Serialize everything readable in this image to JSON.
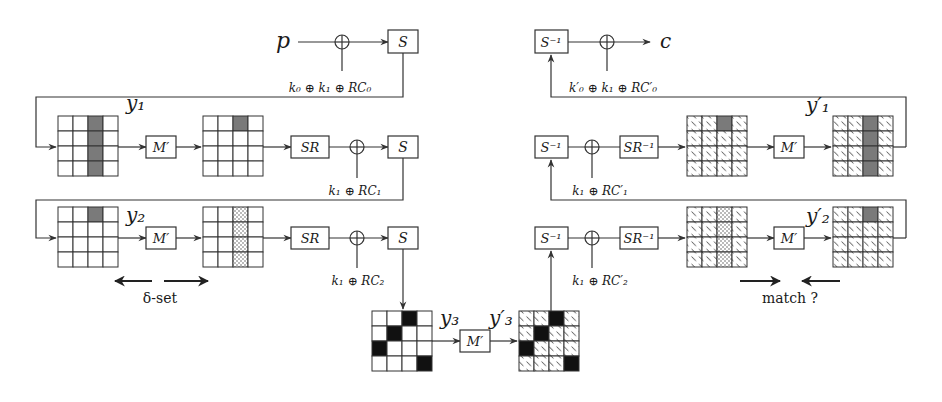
{
  "diagram": {
    "colors": {
      "gray_cell": "#7a7a7a",
      "black_cell": "#111111",
      "stroke": "#333333"
    },
    "top_left": {
      "input_label": "p",
      "sbox_label": "S",
      "key_label": "k₀ ⊕ k₁ ⊕ RC₀"
    },
    "top_right": {
      "output_label": "c",
      "sbox_inv_label": "S⁻¹",
      "key_label": "k′₀ ⊕ k₁ ⊕ RC′₀"
    },
    "row1_left": {
      "state_label": "y₁",
      "mix_label": "M′",
      "shift_label": "SR",
      "sbox_label": "S",
      "key_label": "k₁ ⊕ RC₁"
    },
    "row2_left": {
      "state_label": "y₂",
      "mix_label": "M′",
      "shift_label": "SR",
      "sbox_label": "S",
      "key_label": "k₁ ⊕ RC₂",
      "delta_set_label": "δ-set"
    },
    "row1_right": {
      "state_label": "y′₁",
      "mix_label": "M′",
      "shift_inv_label": "SR⁻¹",
      "sbox_inv_label": "S⁻¹",
      "key_label": "k₁ ⊕ RC′₁"
    },
    "row2_right": {
      "state_label": "y′₂",
      "mix_label": "M′",
      "shift_inv_label": "SR⁻¹",
      "sbox_inv_label": "S⁻¹",
      "key_label": "k₁ ⊕ RC′₂",
      "match_label": "match ?"
    },
    "middle": {
      "y3_label": "y₃",
      "y3p_label": "y′₃",
      "mix_label": "M′"
    },
    "grids": [
      {
        "id": "L1a",
        "x": 58,
        "y": 116,
        "cell": 15,
        "hatched": false,
        "gray": [
          [
            0,
            2
          ],
          [
            1,
            2
          ],
          [
            2,
            2
          ],
          [
            3,
            2
          ]
        ],
        "dots": [],
        "black": []
      },
      {
        "id": "L1b",
        "x": 203,
        "y": 116,
        "cell": 15,
        "hatched": false,
        "gray": [
          [
            0,
            2
          ]
        ],
        "dots": [],
        "black": []
      },
      {
        "id": "L2a",
        "x": 58,
        "y": 207,
        "cell": 15,
        "hatched": false,
        "gray": [
          [
            0,
            2
          ]
        ],
        "dots": [],
        "black": []
      },
      {
        "id": "L2b",
        "x": 203,
        "y": 207,
        "cell": 15,
        "hatched": false,
        "gray": [],
        "dots": [
          [
            0,
            2
          ],
          [
            1,
            2
          ],
          [
            2,
            2
          ],
          [
            3,
            2
          ]
        ],
        "black": []
      },
      {
        "id": "R1a",
        "x": 687,
        "y": 116,
        "cell": 15,
        "hatched": true,
        "gray": [
          [
            0,
            2
          ]
        ],
        "dots": [],
        "black": []
      },
      {
        "id": "R1b",
        "x": 833,
        "y": 116,
        "cell": 15,
        "hatched": true,
        "gray": [
          [
            0,
            2
          ],
          [
            1,
            2
          ],
          [
            2,
            2
          ],
          [
            3,
            2
          ]
        ],
        "dots": [],
        "black": []
      },
      {
        "id": "R2a",
        "x": 687,
        "y": 207,
        "cell": 15,
        "hatched": true,
        "gray": [],
        "dots": [
          [
            0,
            2
          ],
          [
            1,
            2
          ],
          [
            2,
            2
          ],
          [
            3,
            2
          ]
        ],
        "black": []
      },
      {
        "id": "R2b",
        "x": 833,
        "y": 207,
        "cell": 15,
        "hatched": true,
        "gray": [
          [
            0,
            2
          ]
        ],
        "dots": [],
        "black": []
      },
      {
        "id": "Y3",
        "x": 372,
        "y": 311,
        "cell": 15,
        "hatched": false,
        "gray": [],
        "dots": [],
        "black": [
          [
            0,
            2
          ],
          [
            1,
            1
          ],
          [
            2,
            0
          ],
          [
            3,
            3
          ]
        ]
      },
      {
        "id": "Y3p",
        "x": 519,
        "y": 311,
        "cell": 15,
        "hatched": true,
        "gray": [],
        "dots": [],
        "black": [
          [
            0,
            2
          ],
          [
            1,
            1
          ],
          [
            2,
            0
          ],
          [
            3,
            3
          ]
        ]
      }
    ]
  }
}
